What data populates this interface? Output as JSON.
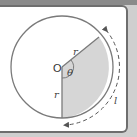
{
  "diagram": {
    "labels": {
      "center": "O",
      "radius_top": "r",
      "radius_bottom": "r",
      "angle": "θ",
      "arc": "l"
    },
    "colors": {
      "sector_fill": "#d6d6d6",
      "stroke": "#7a7a7a",
      "background": "#ffffff",
      "frame": "#6e6e6e"
    }
  }
}
